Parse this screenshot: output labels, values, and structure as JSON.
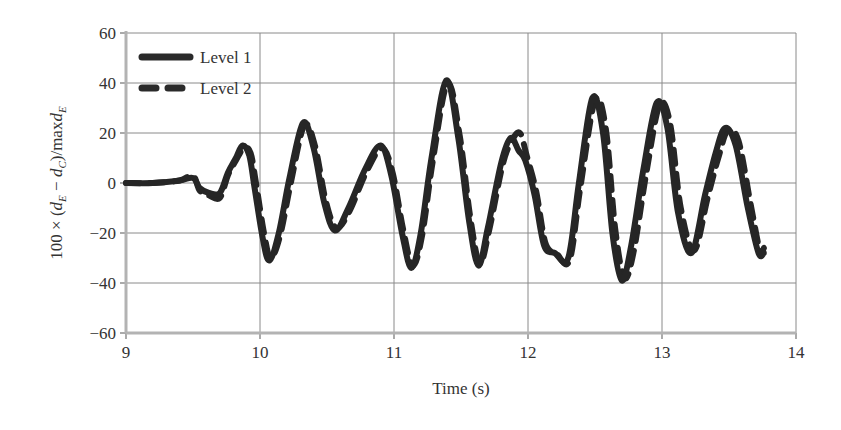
{
  "chart_data": {
    "type": "line",
    "title": "",
    "xlabel": "Time (s)",
    "ylabel": "100 × (d_E − d_C)/maxd_E",
    "xlim": [
      9,
      14
    ],
    "ylim": [
      -60,
      60
    ],
    "xticks": [
      "9",
      "10",
      "11",
      "12",
      "13",
      "14"
    ],
    "yticks": [
      "60",
      "40",
      "20",
      "0",
      "−20",
      "−40",
      "−60"
    ],
    "grid": true,
    "legend_position": "upper-left",
    "series": [
      {
        "name": "Level 1",
        "style": "solid",
        "x": [
          9.0,
          9.2,
          9.4,
          9.5,
          9.55,
          9.62,
          9.7,
          9.76,
          9.82,
          9.87,
          9.92,
          9.96,
          10.02,
          10.07,
          10.14,
          10.22,
          10.32,
          10.4,
          10.48,
          10.56,
          10.66,
          10.78,
          10.9,
          10.98,
          11.06,
          11.13,
          11.2,
          11.28,
          11.39,
          11.48,
          11.56,
          11.63,
          11.7,
          11.8,
          11.87,
          11.93,
          11.98,
          12.05,
          12.12,
          12.2,
          12.3,
          12.38,
          12.48,
          12.56,
          12.63,
          12.7,
          12.77,
          12.86,
          12.96,
          13.04,
          13.12,
          13.22,
          13.32,
          13.4,
          13.47,
          13.55,
          13.64,
          13.72,
          13.76
        ],
        "y": [
          0,
          0,
          1,
          2,
          -2,
          -4,
          -4,
          4,
          10,
          15,
          11,
          -2,
          -22,
          -31,
          -20,
          2,
          24,
          14,
          -8,
          -19,
          -10,
          5,
          15,
          3,
          -20,
          -34,
          -20,
          10,
          41,
          18,
          -15,
          -33,
          -18,
          8,
          18,
          13,
          9,
          -5,
          -25,
          -28,
          -30,
          0,
          34,
          20,
          -20,
          -39,
          -25,
          5,
          32,
          22,
          -12,
          -28,
          -5,
          12,
          22,
          15,
          -10,
          -28,
          -28
        ]
      },
      {
        "name": "Level 2",
        "style": "dashed",
        "x": [
          9.0,
          9.2,
          9.4,
          9.5,
          9.55,
          9.62,
          9.7,
          9.76,
          9.82,
          9.88,
          9.93,
          9.97,
          10.03,
          10.08,
          10.15,
          10.23,
          10.33,
          10.41,
          10.49,
          10.57,
          10.67,
          10.79,
          10.91,
          10.99,
          11.07,
          11.14,
          11.21,
          11.29,
          11.4,
          11.49,
          11.57,
          11.64,
          11.71,
          11.81,
          11.88,
          11.94,
          11.99,
          12.06,
          12.13,
          12.21,
          12.31,
          12.39,
          12.5,
          12.58,
          12.65,
          12.72,
          12.79,
          12.88,
          12.98,
          13.06,
          13.14,
          13.24,
          13.34,
          13.42,
          13.49,
          13.57,
          13.66,
          13.73,
          13.76
        ],
        "y": [
          0,
          0,
          1,
          3,
          -3,
          -5,
          -6,
          3,
          9,
          14,
          12,
          0,
          -20,
          -30,
          -21,
          0,
          23,
          15,
          -7,
          -18,
          -11,
          4,
          14,
          4,
          -19,
          -33,
          -21,
          9,
          40,
          19,
          -14,
          -32,
          -19,
          7,
          17,
          20,
          11,
          -3,
          -24,
          -28,
          -31,
          -2,
          33,
          22,
          -18,
          -38,
          -27,
          3,
          31,
          24,
          -10,
          -27,
          -6,
          10,
          21,
          17,
          -8,
          -27,
          -26
        ]
      }
    ]
  },
  "legend": {
    "items": [
      {
        "label": "Level 1"
      },
      {
        "label": "Level 2"
      }
    ]
  },
  "axes": {
    "xlabel": "Time (s)"
  }
}
